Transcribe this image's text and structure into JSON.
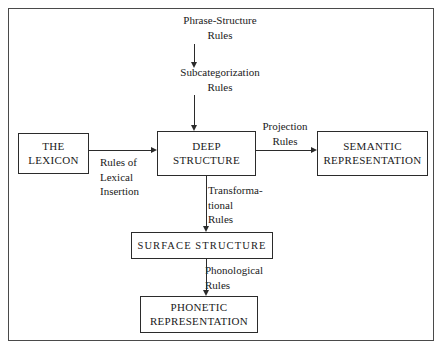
{
  "diagram": {
    "frame_color": "#4a4a4a",
    "line_color": "#2b2b2b",
    "background": "#ffffff",
    "nodes": [
      {
        "id": "lexicon",
        "label": "THE\nLEXICON"
      },
      {
        "id": "deep",
        "label": "DEEP\nSTRUCTURE"
      },
      {
        "id": "semantic",
        "label": "SEMANTIC\nREPRESENTATION"
      },
      {
        "id": "surface",
        "label": "SURFACE STRUCTURE"
      },
      {
        "id": "phonetic",
        "label": "PHONETIC\nREPRESENTATION"
      }
    ],
    "labels": [
      {
        "id": "phrase_structure",
        "text": "Phrase-Structure\nRules"
      },
      {
        "id": "subcategorization",
        "text": "Subcategorization\nRules"
      },
      {
        "id": "lexical_insertion",
        "text": "Rules of\nLexical\nInsertion"
      },
      {
        "id": "projection",
        "text": "Projection\nRules"
      },
      {
        "id": "transformational",
        "text": "Transforma-\ntional\nRules"
      },
      {
        "id": "phonological",
        "text": "Phonological\nRules"
      }
    ]
  }
}
